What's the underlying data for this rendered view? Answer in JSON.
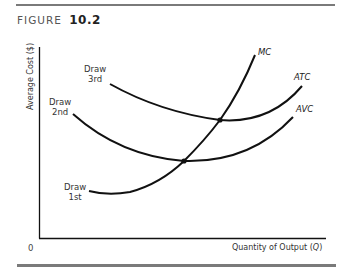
{
  "figure": {
    "label": "FIGURE",
    "number": "10.2"
  },
  "axes": {
    "y_label": "Average Cost ($)",
    "x_label": "Quantity of Output (Q)",
    "origin": "0"
  },
  "curves": {
    "mc": "MC",
    "atc": "ATC",
    "avc": "AVC"
  },
  "annotations": {
    "draw_1st": [
      "Draw",
      "1st"
    ],
    "draw_2nd": [
      "Draw",
      "2nd"
    ],
    "draw_3rd": [
      "Draw",
      "3rd"
    ]
  },
  "colors": {
    "curve": "#111111",
    "rule": "#7a7a7a",
    "text": "#333333"
  }
}
